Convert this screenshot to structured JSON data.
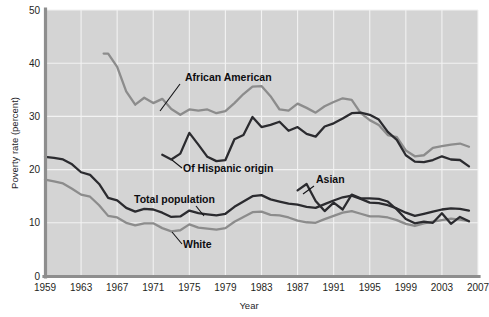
{
  "chart_data": {
    "type": "line",
    "title": "",
    "xlabel": "Year",
    "ylabel": "Poverty rate (percent)",
    "xlim": [
      1959,
      2007
    ],
    "ylim": [
      0,
      50
    ],
    "grid": true,
    "legend_position": "inline-annotations",
    "xticks": [
      "1959",
      "1963",
      "1967",
      "1971",
      "1975",
      "1979",
      "1983",
      "1987",
      "1991",
      "1995",
      "1999",
      "2003",
      "2007"
    ],
    "yticks": [
      "0",
      "10",
      "20",
      "30",
      "40",
      "50"
    ],
    "colors": {
      "plot_background": "#d4d4d4",
      "gridline": "#f2f2f2",
      "axis": "#8e8e8e",
      "dark_series": "#2b2b2f",
      "light_series": "#8c8c8c",
      "label_text": "#0d0d10"
    },
    "series": [
      {
        "name": "African American",
        "color": "#8c8c8c",
        "label": "African American",
        "label_x": 185,
        "label_y": 81,
        "leader": [
          [
            180,
            84
          ],
          [
            160,
            111
          ]
        ],
        "x": [
          1965.5,
          1966,
          1967,
          1968,
          1969,
          1970,
          1971,
          1972,
          1973,
          1974,
          1975,
          1976,
          1977,
          1978,
          1979,
          1980,
          1981,
          1982,
          1983,
          1984,
          1985,
          1986,
          1987,
          1988,
          1989,
          1990,
          1991,
          1992,
          1993,
          1994,
          1995,
          1996,
          1997,
          1998,
          1999,
          2000,
          2001,
          2002,
          2003,
          2004,
          2005,
          2006
        ],
        "values": [
          41.8,
          41.8,
          39.3,
          34.7,
          32.2,
          33.5,
          32.5,
          33.3,
          31.4,
          30.3,
          31.3,
          31.1,
          31.3,
          30.6,
          31.0,
          32.5,
          34.2,
          35.6,
          35.7,
          33.8,
          31.3,
          31.1,
          32.4,
          31.6,
          30.7,
          31.9,
          32.7,
          33.4,
          33.1,
          30.6,
          29.3,
          28.4,
          26.5,
          26.1,
          23.6,
          22.5,
          22.7,
          24.1,
          24.4,
          24.7,
          24.9,
          24.3
        ]
      },
      {
        "name": "Of Hispanic origin",
        "color": "#2b2b2f",
        "label": "Of Hispanic origin",
        "label_x": 183,
        "label_y": 172,
        "leader": [
          [
            182,
            168
          ],
          [
            172,
            160
          ]
        ],
        "x": [
          1972,
          1973,
          1974,
          1975,
          1976,
          1977,
          1978,
          1979,
          1980,
          1981,
          1982,
          1983,
          1984,
          1985,
          1986,
          1987,
          1988,
          1989,
          1990,
          1991,
          1992,
          1993,
          1994,
          1995,
          1996,
          1997,
          1998,
          1999,
          2000,
          2001,
          2002,
          2003,
          2004,
          2005,
          2006
        ],
        "values": [
          22.8,
          21.9,
          23.0,
          26.9,
          24.7,
          22.4,
          21.6,
          21.8,
          25.7,
          26.5,
          29.9,
          28.0,
          28.4,
          29.0,
          27.3,
          28.0,
          26.7,
          26.2,
          28.1,
          28.7,
          29.6,
          30.6,
          30.7,
          30.3,
          29.4,
          27.1,
          25.6,
          22.7,
          21.5,
          21.4,
          21.8,
          22.5,
          21.9,
          21.8,
          20.6
        ]
      },
      {
        "name": "Total population",
        "color": "#2b2b2f",
        "label": "Total population",
        "label_x": 134,
        "label_y": 203,
        "leader": [
          [
            196,
            206
          ],
          [
            204,
            216
          ]
        ],
        "x": [
          1959,
          1960,
          1961,
          1962,
          1963,
          1964,
          1965,
          1966,
          1967,
          1968,
          1969,
          1970,
          1971,
          1972,
          1973,
          1974,
          1975,
          1976,
          1977,
          1978,
          1979,
          1980,
          1981,
          1982,
          1983,
          1984,
          1985,
          1986,
          1987,
          1988,
          1989,
          1990,
          1991,
          1992,
          1993,
          1994,
          1995,
          1996,
          1997,
          1998,
          1999,
          2000,
          2001,
          2002,
          2003,
          2004,
          2005,
          2006
        ],
        "values": [
          22.4,
          22.2,
          21.9,
          21.0,
          19.5,
          19.0,
          17.3,
          14.7,
          14.2,
          12.8,
          12.1,
          12.6,
          12.5,
          11.9,
          11.1,
          11.2,
          12.3,
          11.8,
          11.6,
          11.4,
          11.7,
          13.0,
          14.0,
          15.0,
          15.2,
          14.4,
          14.0,
          13.6,
          13.4,
          13.0,
          12.8,
          13.5,
          14.2,
          14.8,
          15.1,
          14.5,
          13.8,
          13.7,
          13.3,
          12.7,
          11.9,
          11.3,
          11.7,
          12.1,
          12.5,
          12.7,
          12.6,
          12.3
        ]
      },
      {
        "name": "White",
        "color": "#8c8c8c",
        "label": "White",
        "label_x": 183,
        "label_y": 248,
        "leader": [
          [
            182,
            244
          ],
          [
            172,
            232
          ]
        ],
        "x": [
          1959,
          1960,
          1961,
          1962,
          1963,
          1964,
          1965,
          1966,
          1967,
          1968,
          1969,
          1970,
          1971,
          1972,
          1973,
          1974,
          1975,
          1976,
          1977,
          1978,
          1979,
          1980,
          1981,
          1982,
          1983,
          1984,
          1985,
          1986,
          1987,
          1988,
          1989,
          1990,
          1991,
          1992,
          1993,
          1994,
          1995,
          1996,
          1997,
          1998,
          1999,
          2000,
          2001,
          2002,
          2003,
          2004,
          2005,
          2006
        ],
        "values": [
          18.1,
          17.8,
          17.4,
          16.4,
          15.3,
          14.9,
          13.3,
          11.3,
          11.0,
          10.0,
          9.5,
          9.9,
          9.9,
          9.0,
          8.4,
          8.6,
          9.7,
          9.1,
          8.9,
          8.7,
          9.0,
          10.2,
          11.1,
          12.0,
          12.1,
          11.5,
          11.4,
          11.0,
          10.4,
          10.1,
          10.0,
          10.7,
          11.3,
          11.9,
          12.2,
          11.7,
          11.2,
          11.2,
          11.0,
          10.5,
          9.8,
          9.4,
          9.9,
          10.2,
          10.5,
          10.8,
          10.6,
          10.3
        ]
      },
      {
        "name": "Asian",
        "color": "#2b2b2f",
        "label": "Asian",
        "label_x": 316,
        "label_y": 183,
        "leader": [
          [
            314,
            186
          ],
          [
            303,
            194
          ]
        ],
        "x": [
          1987,
          1988,
          1989,
          1990,
          1991,
          1992,
          1993,
          1994,
          1995,
          1996,
          1997,
          1998,
          1999,
          2000,
          2001,
          2002,
          2003,
          2004,
          2005,
          2006
        ],
        "values": [
          16.1,
          17.3,
          14.1,
          12.2,
          13.8,
          12.5,
          15.3,
          14.6,
          14.6,
          14.5,
          14.0,
          12.5,
          10.7,
          9.9,
          10.2,
          10.0,
          11.8,
          9.8,
          11.1,
          10.3
        ]
      }
    ]
  }
}
